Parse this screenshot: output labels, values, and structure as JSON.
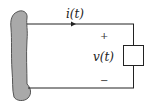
{
  "diagram": {
    "type": "circuit",
    "source": {
      "shape": "irregular-blob",
      "fill": "#a9a9a9",
      "stroke": "#555555"
    },
    "current_label": "i(t)",
    "voltage_label": "v(t)",
    "plus_sign": "+",
    "minus_sign": "−",
    "element": {
      "shape": "rectangle"
    },
    "colors": {
      "wire": "#222222",
      "blob_fill": "#a9a9a9"
    }
  }
}
